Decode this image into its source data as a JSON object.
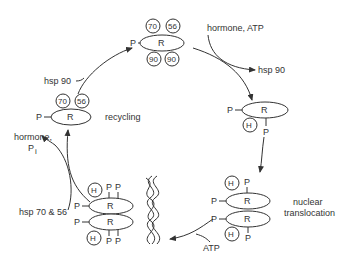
{
  "diagram": {
    "type": "cycle",
    "receptor_label": "R",
    "phosphate_label": "P",
    "hormone_label": "H",
    "states": {
      "top": {
        "hsp_top": [
          "70",
          "56"
        ],
        "hsp_bottom": [
          "90",
          "90"
        ]
      },
      "left": {
        "hsp_top": [
          "70",
          "56"
        ]
      },
      "right": {},
      "nucleus_pair": {},
      "dna_bound_pair": {}
    },
    "labels": {
      "hormone_atp": "hormone, ATP",
      "hsp90_out": "hsp 90",
      "hsp90_in": "hsp 90",
      "recycling": "recycling",
      "hormone_pi_1": "hormone,",
      "hormone_pi_2": "P",
      "hormone_pi_sub": "i",
      "hsp70_56": "hsp 70 & 56",
      "nuclear": "nuclear",
      "translocation": "translocation",
      "atp": "ATP"
    }
  }
}
